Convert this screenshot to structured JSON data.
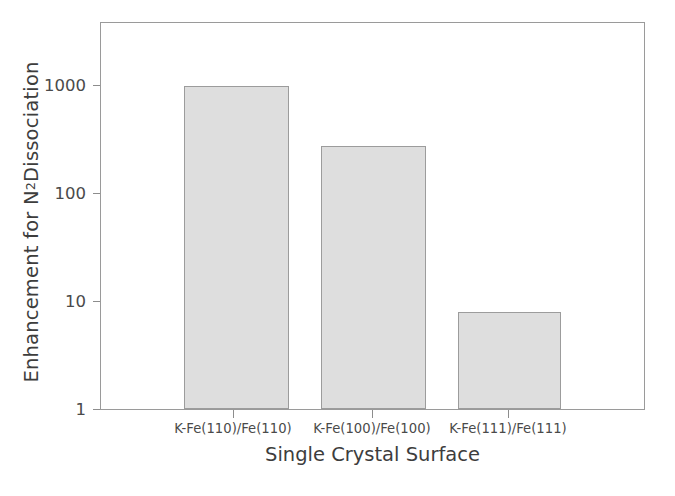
{
  "chart_data": {
    "type": "bar",
    "title": "",
    "subtitle": "",
    "xlabel": "Single Crystal Surface",
    "ylabel_text": "Enhancement for N2 Dissociation",
    "ylabel_prefix": "Enhancement for N",
    "ylabel_sub": "2",
    "ylabel_suffix": " Dissociation",
    "categories": [
      "K-Fe(110)/Fe(110)",
      "K-Fe(100)/Fe(100)",
      "K-Fe(111)/Fe(111)"
    ],
    "values": [
      1000,
      280,
      8
    ],
    "yscale": "log",
    "ylim": [
      1,
      3000
    ],
    "yticks": [
      1000,
      100,
      10,
      1
    ],
    "ytick_labels": [
      "1000",
      "100",
      "10",
      "1"
    ],
    "grid": false,
    "legend": "none",
    "bar_fill_color": "#dedede",
    "bar_edge_color": "#9c9c9c",
    "axis_color": "#9a9a9a",
    "text_color": "#3d3d3d"
  },
  "axes": {
    "y": {
      "ticks": [
        {
          "label": "1000",
          "top_px": 85
        },
        {
          "label": "100",
          "top_px": 193
        },
        {
          "label": "10",
          "top_px": 301
        },
        {
          "label": "1",
          "top_px": 409
        }
      ]
    },
    "x": {
      "ticks": [
        {
          "label": "K-Fe(110)/Fe(110)",
          "center_px": 233
        },
        {
          "label": "K-Fe(100)/Fe(100)",
          "center_px": 372
        },
        {
          "label": "K-Fe(111)/Fe(111)",
          "center_px": 508
        }
      ]
    }
  },
  "bars": [
    {
      "name": "bar-k-fe-110",
      "value": 1000,
      "left_px": 183,
      "width_px": 105,
      "top_px": 85
    },
    {
      "name": "bar-k-fe-100",
      "value": 280,
      "left_px": 320,
      "width_px": 105,
      "top_px": 144
    },
    {
      "name": "bar-k-fe-111",
      "value": 8,
      "left_px": 457,
      "width_px": 103,
      "top_px": 312
    }
  ]
}
